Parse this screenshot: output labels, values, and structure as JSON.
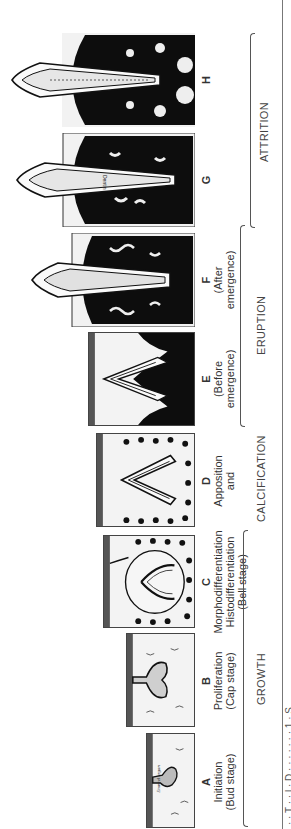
{
  "diagram": {
    "orientation": "rotated-90-ccw",
    "stages": [
      {
        "id": "A",
        "letter": "A",
        "lines": [
          "Initiation",
          "(Bud stage)"
        ],
        "inner_label": "Enamel organ"
      },
      {
        "id": "B",
        "letter": "B",
        "lines": [
          "Proliferation",
          "(Cap stage)"
        ]
      },
      {
        "id": "C",
        "letter": "C",
        "lines": [
          "Morphodifferentiation",
          "Histodifferentiation",
          "(Bell stage)"
        ]
      },
      {
        "id": "D",
        "letter": "D",
        "lines": [
          "Apposition",
          "and"
        ]
      },
      {
        "id": "E",
        "letter": "E",
        "lines": [
          "(Before",
          "emergence)"
        ]
      },
      {
        "id": "F",
        "letter": "F",
        "lines": [
          "(After",
          "emergence)"
        ]
      },
      {
        "id": "G",
        "letter": "G",
        "lines": [],
        "inner_labels": [
          "Pulp",
          "Dentin"
        ]
      },
      {
        "id": "H",
        "letter": "H",
        "lines": []
      }
    ],
    "phases": [
      {
        "id": "growth",
        "label": "GROWTH",
        "spans": [
          "A",
          "B",
          "C",
          "D"
        ]
      },
      {
        "id": "calcification",
        "label": "CALCIFICATION",
        "spans": [
          "D"
        ]
      },
      {
        "id": "eruption",
        "label": "ERUPTION",
        "spans": [
          "E",
          "F"
        ]
      },
      {
        "id": "attrition",
        "label": "ATTRITION",
        "spans": [
          "G",
          "H"
        ]
      }
    ],
    "caption_partial": "· · T · · l · D · · · · · · · 1 · S"
  },
  "colors": {
    "ink": "#111111",
    "paper": "#f3f3f3",
    "bone": "#0d0d0d",
    "rule": "#777777"
  }
}
